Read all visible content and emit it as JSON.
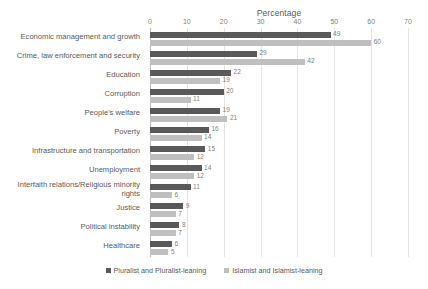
{
  "chart_data": {
    "type": "bar",
    "orientation": "horizontal",
    "title": "",
    "xlabel": "Percentage",
    "ylabel": "",
    "xlim": [
      0,
      70
    ],
    "xticks": [
      0,
      10,
      20,
      30,
      40,
      50,
      60,
      70
    ],
    "grid": true,
    "legend_position": "bottom",
    "categories": [
      "Economic management and growth",
      "Crime, law enforcement and security",
      "Education",
      "Corruption",
      "People's welfare",
      "Poverty",
      "Infrastructure and transportation",
      "Unemployment",
      "Interfaith relations/Religious minority rights",
      "Justice",
      "Political instability",
      "Healthcare"
    ],
    "series": [
      {
        "name": "Pluralist and Pluralist-leaning",
        "color": "#595959",
        "values": [
          49,
          29,
          22,
          20,
          19,
          16,
          15,
          14,
          11,
          9,
          8,
          6
        ]
      },
      {
        "name": "Islamist and Islamist-leaning",
        "color": "#bfbfbf",
        "values": [
          60,
          42,
          19,
          11,
          21,
          14,
          12,
          12,
          6,
          7,
          7,
          5
        ]
      }
    ]
  },
  "axis_title": "Percentage"
}
